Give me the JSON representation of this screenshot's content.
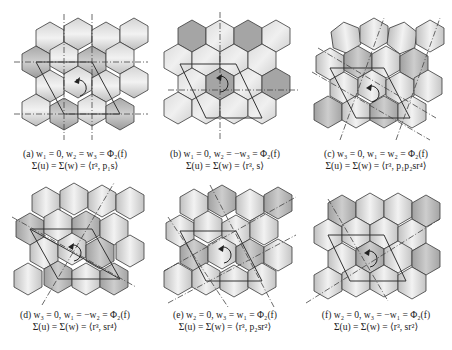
{
  "figure": {
    "panels": [
      {
        "id": "a",
        "condition": "(a) w₁ = 0, w₂ = w₃ = Φ₂(f)",
        "group": "Σ(u) = Σ(w) = ⟨r³, p₁s⟩",
        "axes_angles": [
          0,
          90
        ],
        "shading": "horizontal-bands"
      },
      {
        "id": "b",
        "condition": "(b) w₁ = 0, w₂ = −w₃ = Φ₂(f)",
        "group": "Σ(u) = Σ(w) = ⟨r³, s⟩",
        "axes_angles": [
          0,
          90
        ],
        "shading": "dark-hexagons"
      },
      {
        "id": "c",
        "condition": "(c) w₃ = 0, w₁ = w₂ = Φ₂(f)",
        "group": "Σ(u) = Σ(w) = ⟨r³, p₁p₂sr⁴⟩",
        "axes_angles": [
          60,
          -30
        ],
        "shading": "diagonal-bands"
      },
      {
        "id": "d",
        "condition": "(d) w₃ = 0, w₁ = −w₂ = Φ₂(f)",
        "group": "Σ(u) = Σ(w) = ⟨r³, sr⁴⟩",
        "axes_angles": [
          60,
          -30
        ],
        "shading": "diagonal-bands"
      },
      {
        "id": "e",
        "condition": "(e) w₂ = 0, w₃ = w₁ = Φ₂(f)",
        "group": "Σ(u) = Σ(w) = ⟨r³, p₂sr²⟩",
        "axes_angles": [
          120,
          30
        ],
        "shading": "diagonal-bands"
      },
      {
        "id": "f",
        "condition": "(f) w₂ = 0, w₃ = −w₁ = Φ₂(f)",
        "group": "Σ(u) = Σ(w) = ⟨r³, sr²⟩",
        "axes_angles": [
          120,
          30
        ],
        "shading": "diagonal-bands"
      }
    ],
    "colors": {
      "hex_light": "#e6e6e6",
      "hex_mid": "#c8c8c8",
      "hex_dark": "#9e9e9e",
      "stroke": "#3a3a3a",
      "axis": "#444444"
    }
  }
}
